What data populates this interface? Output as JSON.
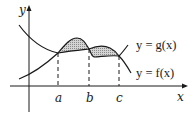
{
  "figure": {
    "axes": {
      "x_label": "x",
      "y_label": "y"
    },
    "points": [
      {
        "label": "a"
      },
      {
        "label": "b"
      },
      {
        "label": "c"
      }
    ],
    "curves": [
      {
        "label": "y = g(x)"
      },
      {
        "label": "y = f(x)"
      }
    ],
    "colors": {
      "line": "#1a1a1a",
      "shade": "#bdbdbd"
    }
  }
}
